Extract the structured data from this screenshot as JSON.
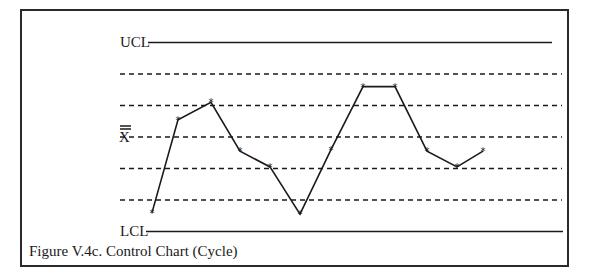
{
  "chart_data": {
    "type": "line",
    "title": "Figure V.4c.  Control Chart (Cycle)",
    "xlabel": "",
    "ylabel": "",
    "grid": false,
    "legend": null,
    "reference_lines": [
      {
        "name": "UCL",
        "label": "UCL",
        "level": 3,
        "style": "solid"
      },
      {
        "name": "+2 sigma",
        "label": "",
        "level": 2,
        "style": "dashed"
      },
      {
        "name": "+1 sigma",
        "label": "",
        "level": 1,
        "style": "dashed"
      },
      {
        "name": "X-double-bar",
        "label": "X̅̅",
        "level": 0,
        "style": "dashed"
      },
      {
        "name": "-1 sigma",
        "label": "",
        "level": -1,
        "style": "dashed"
      },
      {
        "name": "-2 sigma",
        "label": "",
        "level": -2,
        "style": "dashed"
      },
      {
        "name": "LCL",
        "label": "LCL",
        "level": -3,
        "style": "solid"
      }
    ],
    "ylim": [
      -3,
      3
    ],
    "x": [
      1,
      2,
      3,
      4,
      5,
      6,
      7,
      8,
      9,
      10,
      11,
      12
    ],
    "series": [
      {
        "name": "Process",
        "marker": "*",
        "values": [
          -2.4,
          0.55,
          1.1,
          -0.45,
          -0.95,
          -2.45,
          -0.4,
          1.6,
          1.6,
          -0.45,
          -0.95,
          -0.45
        ]
      }
    ],
    "annotations": [
      "UCL",
      "X̅̅",
      "LCL"
    ]
  },
  "labels": {
    "ucl": "UCL",
    "lcl": "LCL",
    "xbar": "X",
    "caption": "Figure V.4c.  Control Chart (Cycle)"
  },
  "colors": {
    "line": "#1a1a1a",
    "frame": "#2a2a2a",
    "background": "#ffffff"
  }
}
